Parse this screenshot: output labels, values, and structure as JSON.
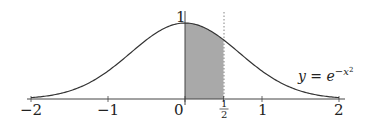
{
  "chart_data": {
    "type": "line",
    "title": "",
    "function_label": "y = e^{-x^2}",
    "function_label_parts": {
      "lhs": "y",
      "eq": " = ",
      "base": "e",
      "exp": "−x",
      "exp_power": "2"
    },
    "xlabel": "",
    "ylabel": "",
    "xlim": [
      -2,
      2
    ],
    "ylim": [
      0,
      1
    ],
    "x_ticks": [
      -2,
      -1,
      0,
      0.5,
      1,
      2
    ],
    "x_tick_labels": [
      "−2",
      "−1",
      "0",
      "1/2",
      "1",
      "2"
    ],
    "y_tick_labels": [
      "1"
    ],
    "half_label": {
      "num": "1",
      "den": "2"
    },
    "shaded_region": {
      "from": 0,
      "to": 0.5,
      "color": "#a9a9a9"
    },
    "dashed_line_x": 0.5,
    "grid": false,
    "series": [
      {
        "name": "y = e^{-x^2}",
        "x": [
          -2,
          -1.5,
          -1,
          -0.5,
          0,
          0.5,
          1,
          1.5,
          2
        ],
        "y": [
          0.018,
          0.105,
          0.368,
          0.779,
          1,
          0.779,
          0.368,
          0.105,
          0.018
        ]
      }
    ]
  }
}
